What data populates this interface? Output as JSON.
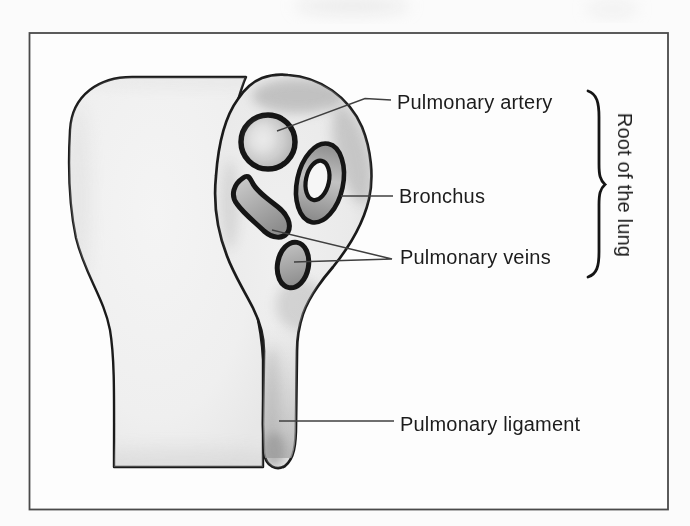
{
  "figure": {
    "kind": "anatomical line diagram, scanned book illustration"
  },
  "labels": {
    "pulmonary_artery": "Pulmonary artery",
    "bronchus": "Bronchus",
    "pulmonary_veins": "Pulmonary veins",
    "pulmonary_ligament": "Pulmonary ligament",
    "root_of_lung": "Root of the lung"
  },
  "colors": {
    "background": "#fbfbfb",
    "frame": "#4a4a4a",
    "outline_black": "#1a1a1a",
    "leader_line": "#3f3f3f",
    "label_text": "#1c1c1c",
    "lung_fill": "#f1f1f1",
    "hilum_fill": "#ececec",
    "artery_fill": "#c6c6c6",
    "bronchus_wall": "#a3a3a3",
    "bronchus_lumen": "#f6f6f6",
    "vein_fill": "#a0a0a0",
    "ligament_shade": "#b0b0b0"
  }
}
